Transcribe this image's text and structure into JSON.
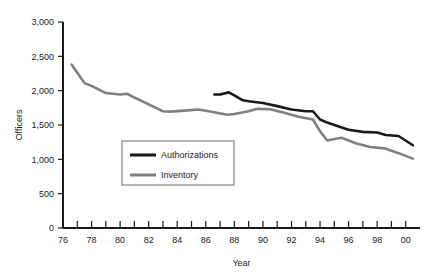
{
  "credit": {
    "mark": "RAND",
    "document": "MR1479-4.4"
  },
  "chart_data": {
    "type": "line",
    "title": "",
    "xlabel": "Year",
    "ylabel": "Officers",
    "xlim": [
      1976,
      2001
    ],
    "ylim": [
      0,
      3000
    ],
    "grid": false,
    "legend_position": "inside-lower-left",
    "y_ticks": [
      0,
      500,
      1000,
      1500,
      2000,
      2500,
      3000
    ],
    "y_tick_labels": [
      "0",
      "500",
      "1,000",
      "1,500",
      "2,000",
      "2,500",
      "3,000"
    ],
    "x_ticks": [
      1976,
      1978,
      1980,
      1982,
      1984,
      1986,
      1988,
      1990,
      1992,
      1994,
      1996,
      1998,
      2000
    ],
    "x_tick_labels": [
      "76",
      "78",
      "80",
      "82",
      "84",
      "86",
      "88",
      "90",
      "92",
      "94",
      "96",
      "98",
      "00"
    ],
    "x_minor_ticks": [
      1977,
      1979,
      1981,
      1983,
      1985,
      1987,
      1989,
      1991,
      1993,
      1995,
      1997,
      1999
    ],
    "colors": {
      "authorizations": "#1a1a1a",
      "inventory": "#808080",
      "axis": "#1a1a1a",
      "background": "#ffffff"
    },
    "series": [
      {
        "name": "Authorizations",
        "color": "#1a1a1a",
        "x": [
          1986.6,
          1987.0,
          1987.6,
          1988.0,
          1988.6,
          1989.0,
          1990.0,
          1991.0,
          1992.0,
          1993.0,
          1993.5,
          1994.0,
          1994.5,
          1995.0,
          1996.0,
          1997.0,
          1998.0,
          1998.6,
          1999.5,
          2000.5
        ],
        "values": [
          1945,
          1945,
          1975,
          1930,
          1860,
          1845,
          1820,
          1775,
          1725,
          1700,
          1700,
          1580,
          1535,
          1500,
          1430,
          1400,
          1390,
          1355,
          1340,
          1205
        ]
      },
      {
        "name": "Inventory",
        "color": "#808080",
        "x": [
          1976.6,
          1977.5,
          1978.0,
          1979.0,
          1980.0,
          1980.5,
          1981.0,
          1982.0,
          1983.0,
          1983.5,
          1984.5,
          1985.5,
          1986.5,
          1987.5,
          1988.0,
          1989.0,
          1989.6,
          1990.5,
          1991.5,
          1992.5,
          1993.5,
          1994.0,
          1994.5,
          1995.5,
          1996.5,
          1997.5,
          1998.5,
          1999.5,
          2000.5
        ],
        "values": [
          2380,
          2110,
          2070,
          1965,
          1945,
          1955,
          1900,
          1800,
          1700,
          1695,
          1710,
          1725,
          1690,
          1650,
          1660,
          1700,
          1735,
          1730,
          1680,
          1620,
          1580,
          1410,
          1275,
          1315,
          1235,
          1180,
          1160,
          1090,
          1010
        ]
      }
    ],
    "legend_entries": [
      {
        "label": "Authorizations",
        "color": "#1a1a1a"
      },
      {
        "label": "Inventory",
        "color": "#808080"
      }
    ]
  }
}
